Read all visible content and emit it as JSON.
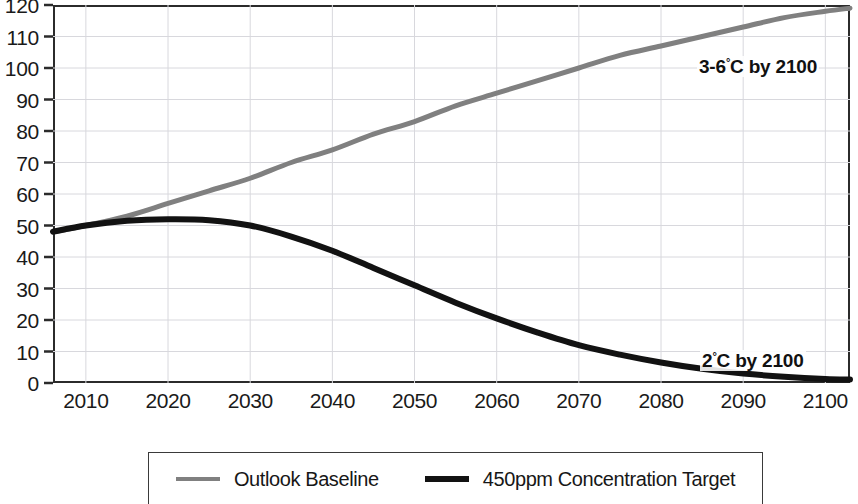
{
  "chart_data": {
    "type": "line",
    "title": "",
    "subtitle": "",
    "xlabel": "",
    "ylabel": "",
    "xlim": [
      2006,
      2103
    ],
    "ylim": [
      0,
      120
    ],
    "grid": true,
    "legend_position": "bottom",
    "x_ticks": [
      2010,
      2020,
      2030,
      2040,
      2050,
      2060,
      2070,
      2080,
      2090,
      2100
    ],
    "y_ticks": [
      0,
      10,
      20,
      30,
      40,
      50,
      60,
      70,
      80,
      90,
      100,
      110,
      120
    ],
    "x": [
      2006,
      2010,
      2015,
      2020,
      2025,
      2030,
      2035,
      2040,
      2045,
      2050,
      2055,
      2060,
      2065,
      2070,
      2075,
      2080,
      2085,
      2090,
      2095,
      2100,
      2103
    ],
    "series": [
      {
        "name": "Outlook Baseline",
        "color": "#808080",
        "width": 5,
        "values": [
          48,
          50,
          53,
          57,
          61,
          65,
          70,
          74,
          79,
          83,
          88,
          92,
          96,
          100,
          104,
          107,
          110,
          113,
          116,
          118,
          119
        ]
      },
      {
        "name": "450ppm Concentration Target",
        "color": "#121212",
        "width": 6,
        "values": [
          48,
          50,
          51.5,
          52,
          51.7,
          50,
          46.5,
          42,
          36.5,
          31,
          25.5,
          20.5,
          16,
          12,
          9,
          6.5,
          4.5,
          3,
          2,
          1.3,
          1.1
        ]
      }
    ],
    "annotations": [
      {
        "id": "baseline",
        "text_before": "3-6",
        "degree": "°",
        "text_after": "C by 2100"
      },
      {
        "id": "target",
        "text_before": "2",
        "degree": "°",
        "text_after": "C by 2100"
      }
    ]
  },
  "axes": {
    "y_tick_labels": [
      "120",
      "110",
      "100",
      "90",
      "80",
      "70",
      "60",
      "50",
      "40",
      "30",
      "20",
      "10",
      "0"
    ],
    "x_tick_labels": [
      "2010",
      "2020",
      "2030",
      "2040",
      "2050",
      "2060",
      "2070",
      "2080",
      "2090",
      "2100"
    ]
  },
  "legend": {
    "items": [
      {
        "label": "Outlook Baseline",
        "color": "#808080",
        "weight": "thin"
      },
      {
        "label": "450ppm Concentration Target",
        "color": "#121212",
        "weight": "thick"
      }
    ]
  },
  "colors": {
    "baseline_line": "#808080",
    "target_line": "#121212",
    "axis": "#2b2b2b",
    "grid": "#d8d8dd",
    "background": "#ffffff",
    "text": "#1a1a1a"
  }
}
